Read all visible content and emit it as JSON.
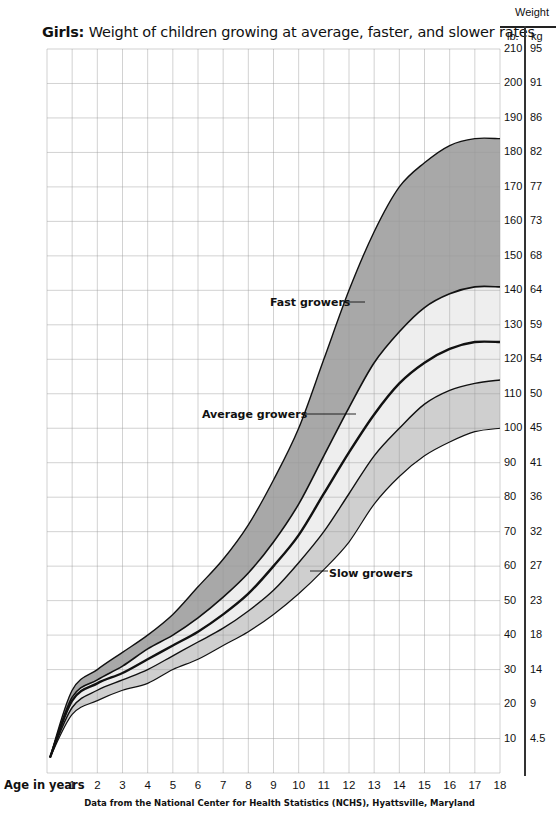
{
  "chart_data": {
    "type": "area",
    "title": "Girls: Weight of children growing at average, faster, and slower rates",
    "title_bold_prefix": "Girls:",
    "title_rest": " Weight of children growing at average, faster, and slower rates",
    "xlabel": "Age in years",
    "ylabel": "Weight",
    "y_units": [
      "lb.",
      "kg"
    ],
    "xlim": [
      0,
      18
    ],
    "ylim": [
      0,
      210
    ],
    "grid": true,
    "x_ticks": [
      1,
      2,
      3,
      4,
      5,
      6,
      7,
      8,
      9,
      10,
      11,
      12,
      13,
      14,
      15,
      16,
      17,
      18
    ],
    "y_ticks_lb": [
      210,
      200,
      190,
      180,
      170,
      160,
      150,
      140,
      130,
      120,
      110,
      100,
      90,
      80,
      70,
      60,
      50,
      40,
      30,
      20,
      10
    ],
    "y_ticks_kg": [
      "95",
      "91",
      "86",
      "82",
      "77",
      "73",
      "68",
      "64",
      "59",
      "54",
      "50",
      "45",
      "41",
      "36",
      "32",
      "27",
      "23",
      "18",
      "14",
      "9",
      "4.5"
    ],
    "x": [
      0,
      1,
      2,
      3,
      4,
      5,
      6,
      7,
      8,
      9,
      10,
      11,
      12,
      13,
      14,
      15,
      16,
      17,
      18
    ],
    "series": [
      {
        "name": "Fast growers (upper bound)",
        "values": [
          4.5,
          24,
          30,
          35,
          40,
          46,
          54,
          62,
          72,
          85,
          100,
          120,
          140,
          157,
          170,
          177,
          182,
          184,
          184
        ]
      },
      {
        "name": "Fast growers (lower bound) / Average upper",
        "values": [
          4.5,
          22,
          27,
          31,
          36,
          40,
          45,
          51,
          58,
          67,
          78,
          92,
          106,
          119,
          128,
          135,
          139,
          141,
          141
        ]
      },
      {
        "name": "Average growers",
        "values": [
          4.5,
          21,
          26,
          29,
          33,
          37,
          41,
          46,
          52,
          60,
          69,
          81,
          93,
          104,
          113,
          119,
          123,
          125,
          125
        ]
      },
      {
        "name": "Slow growers (upper bound) / Average lower",
        "values": [
          4.5,
          19,
          24,
          27,
          30,
          34,
          38,
          42,
          47,
          53,
          61,
          70,
          81,
          92,
          100,
          107,
          111,
          113,
          114
        ]
      },
      {
        "name": "Slow growers (lower bound)",
        "values": [
          4.5,
          17,
          21,
          24,
          26,
          30,
          33,
          37,
          41,
          46,
          52,
          59,
          67,
          78,
          86,
          92,
          96,
          99,
          100
        ]
      }
    ],
    "bands": [
      {
        "name": "Fast growers",
        "between": [
          0,
          1
        ],
        "color": "#a8a8a8"
      },
      {
        "name": "Average growers",
        "between": [
          1,
          3
        ],
        "color": "#eeeeee"
      },
      {
        "name": "Slow growers",
        "between": [
          3,
          4
        ],
        "color": "#cfcfcf"
      }
    ],
    "annotations": [
      {
        "text": "Fast growers",
        "x_age": 12,
        "y_lb": 136
      },
      {
        "text": "Average growers",
        "x_age": 11.5,
        "y_lb": 104
      },
      {
        "text": "Slow growers",
        "x_age": 11,
        "y_lb": 58
      }
    ],
    "source": "Data from the National Center for Health Statistics (NCHS), Hyattsville, Maryland"
  },
  "header": {
    "weight": "Weight",
    "lb": "lb.",
    "kg": "kg"
  },
  "labels": {
    "fast": "Fast growers",
    "average": "Average growers",
    "slow": "Slow growers"
  }
}
